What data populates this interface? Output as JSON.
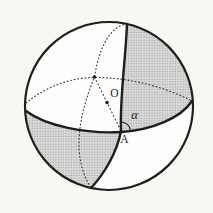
{
  "figure": {
    "labels": {
      "center": "O",
      "vertex": "A",
      "angle": "α"
    },
    "colors": {
      "ink": "#1e1e1e",
      "dotted_ink": "#3c3c3c",
      "paper": "#f8f7f3",
      "sphere_fill": "#fdfdfb",
      "shade_base": "#d8d8d6",
      "shade_dot": "#8f8f8d"
    }
  }
}
